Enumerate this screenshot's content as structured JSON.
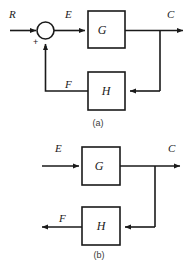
{
  "figure": {
    "background_color": "#ffffff",
    "line_color": "#1a1a1a",
    "diagrams": [
      {
        "caption": "(a)",
        "type": "closed-loop-feedback",
        "signals": {
          "input": "R",
          "error": "E",
          "output": "C",
          "feedback": "F"
        },
        "blocks": [
          {
            "name": "G",
            "label": "G",
            "role": "forward-path"
          },
          {
            "name": "H",
            "label": "H",
            "role": "feedback-path"
          }
        ],
        "summing_junction": {
          "positive_sign": "+",
          "negative_sign": "-"
        }
      },
      {
        "caption": "(b)",
        "type": "open-loop-path",
        "signals": {
          "input": "E",
          "output": "C",
          "feedback": "F"
        },
        "blocks": [
          {
            "name": "G",
            "label": "G",
            "role": "forward-path"
          },
          {
            "name": "H",
            "label": "H",
            "role": "feedback-path"
          }
        ]
      }
    ]
  }
}
